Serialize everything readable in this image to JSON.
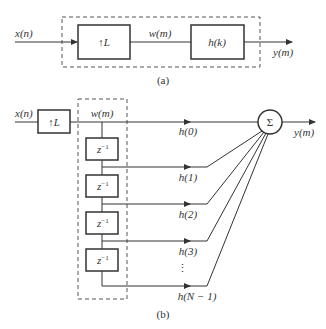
{
  "diagram_a": {
    "input_label": "x(n)",
    "upsampler_label": "↑L",
    "intermediate_label": "w(m)",
    "filter_label": "h(k)",
    "output_label": "y(m)",
    "caption": "(a)"
  },
  "diagram_b": {
    "input_label": "x(n)",
    "upsampler_label": "↑L",
    "intermediate_label": "w(m)",
    "delay_label": "z",
    "delay_exp": "−1",
    "taps": [
      "h(0)",
      "h(1)",
      "h(2)",
      "h(3)",
      "h(N − 1)"
    ],
    "ellipsis": "⋮",
    "sum_label": "Σ",
    "output_label": "y(m)",
    "caption": "(b)"
  },
  "colors": {
    "line": "#333333",
    "dash": "#555555"
  }
}
